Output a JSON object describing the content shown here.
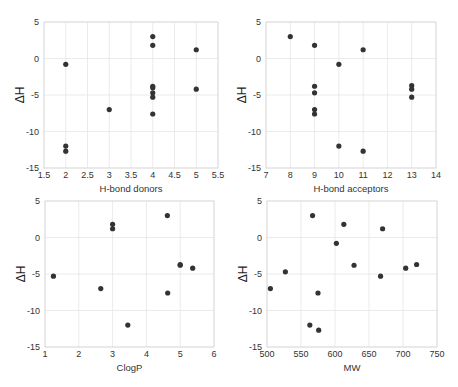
{
  "chart_data": [
    {
      "type": "scatter",
      "title": "",
      "xlabel": "H-bond donors",
      "ylabel": "ΔH",
      "xlim": [
        1.5,
        5.5
      ],
      "ylim": [
        -15,
        5
      ],
      "xticks": [
        "1.5",
        "2",
        "2.5",
        "3",
        "3.5",
        "4",
        "4.5",
        "5",
        "5.5"
      ],
      "yticks": [
        "5",
        "0",
        "-5",
        "-10",
        "-15"
      ],
      "grid": true,
      "x": [
        2,
        2,
        2,
        3,
        4,
        4,
        4,
        4,
        4,
        4,
        4,
        5,
        5
      ],
      "y": [
        -0.8,
        -12.0,
        -12.7,
        -7.0,
        3.0,
        1.8,
        -3.8,
        -4.0,
        -4.7,
        -5.3,
        -7.6,
        1.2,
        -4.2
      ]
    },
    {
      "type": "scatter",
      "title": "",
      "xlabel": "H-bond acceptors",
      "ylabel": "ΔH",
      "xlim": [
        7,
        14
      ],
      "ylim": [
        -15,
        5
      ],
      "xticks": [
        "7",
        "8",
        "9",
        "10",
        "11",
        "12",
        "13",
        "14"
      ],
      "yticks": [
        "5",
        "0",
        "-5",
        "-10",
        "-15"
      ],
      "grid": true,
      "x": [
        8,
        9,
        9,
        9,
        9,
        9,
        10,
        10,
        11,
        11,
        13,
        13,
        13
      ],
      "y": [
        3.0,
        1.8,
        -3.8,
        -4.7,
        -7.0,
        -7.6,
        -0.8,
        -12.0,
        1.2,
        -12.7,
        -3.7,
        -4.2,
        -5.3
      ]
    },
    {
      "type": "scatter",
      "title": "",
      "xlabel": "ClogP",
      "ylabel": "ΔH",
      "xlim": [
        1,
        6
      ],
      "ylim": [
        -15,
        5
      ],
      "xticks": [
        "1",
        "2",
        "3",
        "4",
        "5",
        "6"
      ],
      "yticks": [
        "5",
        "0",
        "-5",
        "-10",
        "-15"
      ],
      "grid": true,
      "x": [
        1.25,
        2.65,
        3.0,
        3.0,
        3.45,
        4.62,
        4.63,
        5.0,
        5.0,
        5.37
      ],
      "y": [
        -5.3,
        -7.0,
        1.8,
        1.2,
        -12.0,
        3.0,
        -7.6,
        -3.7,
        -3.8,
        -4.2
      ]
    },
    {
      "type": "scatter",
      "title": "",
      "xlabel": "MW",
      "ylabel": "ΔH",
      "xlim": [
        500,
        750
      ],
      "ylim": [
        -15,
        5
      ],
      "xticks": [
        "500",
        "550",
        "600",
        "650",
        "700",
        "750"
      ],
      "yticks": [
        "5",
        "0",
        "-5",
        "-10",
        "-15"
      ],
      "grid": true,
      "x": [
        505,
        527,
        563,
        567,
        575,
        576,
        602,
        613,
        628,
        667,
        670,
        704,
        720
      ],
      "y": [
        -7.0,
        -4.7,
        -12.0,
        3.0,
        -7.6,
        -12.7,
        -0.8,
        1.8,
        -3.8,
        -5.3,
        1.2,
        -4.2,
        -3.7
      ]
    }
  ],
  "panels": [
    {
      "xlabel": "H-bond donors",
      "ylabel": "ΔH"
    },
    {
      "xlabel": "H-bond acceptors",
      "ylabel": "ΔH"
    },
    {
      "xlabel": "ClogP",
      "ylabel": "ΔH"
    },
    {
      "xlabel": "MW",
      "ylabel": "ΔH"
    }
  ]
}
